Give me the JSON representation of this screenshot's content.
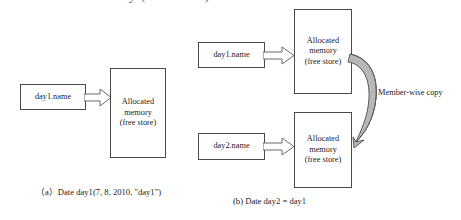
{
  "figure": {
    "top_cut_text": "Allocated memory (free store)",
    "background_color": "#ffffff",
    "line_color": "#4a4a4a",
    "arrow_fill": "#ffffff",
    "curve_fill": "#b8b8b8",
    "text_color": "#1b1b1b"
  },
  "panel_a": {
    "caption": "（a）Date day1(7, 8, 2010, \"day1\")",
    "variable_box": {
      "label": "day1.name"
    },
    "heap_box": {
      "line1": "Allocated",
      "line2": "memory",
      "line3": "(free store)"
    },
    "arrow": {
      "icon": "block-arrow-right-icon"
    }
  },
  "panel_b": {
    "caption": "(b) Date  day2 = day1",
    "variable_box_top": {
      "label": "day1.name"
    },
    "variable_box_bottom": {
      "label": "day2.name"
    },
    "heap_box_top": {
      "line1": "Allocated",
      "line2": "memory",
      "line3": "(free store)"
    },
    "heap_box_bottom": {
      "line1": "Allocated",
      "line2": "memory",
      "line3": "(free store)"
    },
    "arrow_top": {
      "icon": "block-arrow-right-icon"
    },
    "arrow_bottom": {
      "icon": "block-arrow-right-icon"
    },
    "copy_arrow": {
      "label": "Member-wise copy",
      "icon": "curved-copy-arrow-icon"
    }
  }
}
